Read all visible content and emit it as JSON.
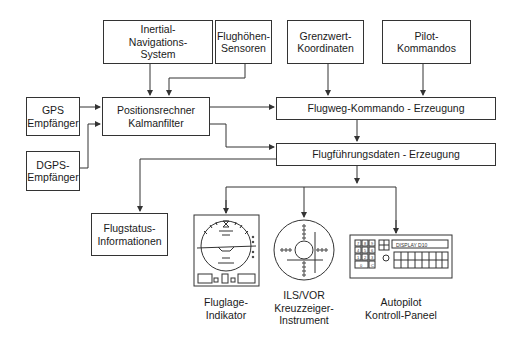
{
  "diagram": {
    "boxes": {
      "ins": {
        "lines": [
          "Inertial-",
          "Navigations-",
          "System"
        ]
      },
      "altitude": {
        "lines": [
          "Flughöhen-",
          "Sensoren"
        ]
      },
      "limits": {
        "lines": [
          "Grenzwert-",
          "Koordinaten"
        ]
      },
      "pilot": {
        "lines": [
          "Pilot-",
          "Kommandos"
        ]
      },
      "gps": {
        "lines": [
          "GPS",
          "Empfänger"
        ]
      },
      "dgps": {
        "lines": [
          "DGPS-",
          "Empfänger"
        ]
      },
      "position": {
        "lines": [
          "Positionsrechner",
          "Kalmanfilter"
        ]
      },
      "flightpath": {
        "lines": [
          "Flugweg-Kommando - Erzeugung"
        ]
      },
      "guidance": {
        "lines": [
          "Flugführungsdaten - Erzeugung"
        ]
      },
      "status": {
        "lines": [
          "Flugstatus-",
          "Informationen"
        ]
      }
    },
    "instruments": {
      "attitude": {
        "lines": [
          "Fluglage-",
          "Indikator"
        ],
        "icon": "attitude-indicator-icon"
      },
      "ilsvor": {
        "lines": [
          "ILS/VOR",
          "Kreuzzeiger-",
          "Instrument"
        ],
        "icon": "crosspointer-instrument-icon"
      },
      "autopilot": {
        "lines": [
          "Autopilot",
          "Kontroll-Paneel"
        ],
        "icon": "autopilot-panel-icon",
        "display_text": "DISPLAY D10",
        "keypad": [
          "7",
          "8",
          "9",
          "4",
          "5",
          "6",
          "1",
          "2",
          "3",
          "0",
          "C"
        ]
      }
    },
    "colors": {
      "line": "#333333",
      "background": "#ffffff"
    }
  }
}
